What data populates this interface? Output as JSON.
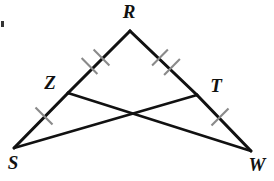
{
  "figure": {
    "shape_type": "triangle-with-intersecting-cevians",
    "stroke_color": "#111111",
    "tick_color": "#8a8a8a",
    "background_color": "#ffffff",
    "width": 274,
    "height": 181
  },
  "points": {
    "R": {
      "label": "R",
      "x": 130,
      "y": 31,
      "label_x": 129,
      "label_y": 13
    },
    "S": {
      "label": "S",
      "x": 14,
      "y": 148,
      "label_x": 13,
      "label_y": 164
    },
    "W": {
      "label": "W",
      "x": 251,
      "y": 151,
      "label_x": 256,
      "label_y": 166
    },
    "Z": {
      "label": "Z",
      "x": 68,
      "y": 93,
      "label_x": 50,
      "label_y": 84
    },
    "T": {
      "label": "T",
      "x": 197,
      "y": 95,
      "label_x": 216,
      "label_y": 87
    },
    "X": {
      "label": "",
      "x": 131,
      "y": 113,
      "label_x": 131,
      "label_y": 113
    }
  },
  "segments": [
    {
      "name": "segment-R-Z",
      "from": "R",
      "to": "Z",
      "ticks": 2
    },
    {
      "name": "segment-Z-S",
      "from": "Z",
      "to": "S",
      "ticks": 1
    },
    {
      "name": "segment-R-T",
      "from": "R",
      "to": "T",
      "ticks": 2
    },
    {
      "name": "segment-T-W",
      "from": "T",
      "to": "W",
      "ticks": 1
    },
    {
      "name": "segment-Z-W",
      "from": "Z",
      "to": "W",
      "ticks": 0
    },
    {
      "name": "segment-T-S",
      "from": "T",
      "to": "S",
      "ticks": 0
    }
  ],
  "tick_marks": {
    "segment_RZ": [
      {
        "cx": 89.5,
        "cy": 66.0
      },
      {
        "cx": 101.5,
        "cy": 57.5
      }
    ],
    "segment_RT": [
      {
        "cx": 160.0,
        "cy": 57.5
      },
      {
        "cx": 172.0,
        "cy": 67.0
      }
    ],
    "segment_ZS": [
      {
        "cx": 44.0,
        "cy": 116.0
      }
    ],
    "segment_TW": [
      {
        "cx": 220.0,
        "cy": 117.0
      }
    ]
  },
  "labels": {
    "R": "R",
    "S": "S",
    "W": "W",
    "Z": "Z",
    "T": "T"
  },
  "artifact": {
    "name": "edge-speck",
    "x": 1,
    "y": 21,
    "w": 3,
    "h": 6
  }
}
